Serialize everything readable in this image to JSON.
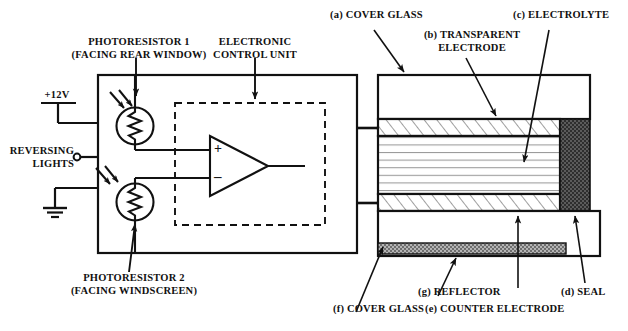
{
  "diagram": {
    "type": "schematic"
  },
  "circuit": {
    "supply_label": "+12V",
    "reversing_label_line1": "REVERSING",
    "reversing_label_line2": "LIGHTS",
    "ecu_label_line1": "ELECTRONIC",
    "ecu_label_line2": "CONTROL UNIT",
    "photoresistor1_line1": "PHOTORESISTOR 1",
    "photoresistor1_line2": "(FACING REAR WINDOW)",
    "photoresistor2_line1": "PHOTORESISTOR 2",
    "photoresistor2_line2": "(FACING WINDSCREEN)",
    "opamp_plus": "+",
    "opamp_minus": "–"
  },
  "cell": {
    "layers": [
      {
        "key": "a",
        "label": "(a) COVER GLASS",
        "name": "cover-glass-top",
        "fill": "white"
      },
      {
        "key": "b",
        "label": "(b) TRANSPARENT",
        "label2": "ELECTRODE",
        "name": "transparent-electrode",
        "fill": "hatch"
      },
      {
        "key": "c",
        "label": "(c) ELECTROLYTE",
        "name": "electrolyte",
        "fill": "lines"
      },
      {
        "key": "d",
        "label": "(d) SEAL",
        "name": "seal",
        "fill": "dark-stipple"
      },
      {
        "key": "e",
        "label": "(e) COUNTER ELECTRODE",
        "name": "counter-electrode",
        "fill": "hatch"
      },
      {
        "key": "f",
        "label": "(f) COVER GLASS",
        "name": "cover-glass-bottom",
        "fill": "white"
      },
      {
        "key": "g",
        "label": "(g) REFLECTOR",
        "name": "reflector",
        "fill": "mid-stipple"
      }
    ],
    "label_a": "(a) COVER GLASS",
    "label_b_line1": "(b) TRANSPARENT",
    "label_b_line2": "ELECTRODE",
    "label_c": "(c) ELECTROLYTE",
    "label_d": "(d) SEAL",
    "label_e": "(e) COUNTER ELECTRODE",
    "label_f": "(f) COVER GLASS",
    "label_g": "(g) REFLECTOR"
  },
  "colors": {
    "stroke": "#111111",
    "background": "#ffffff",
    "seal_fill": "#4a4a4a",
    "reflector_fill": "#8f8f8f",
    "electrolyte_line": "#9a9a9a"
  }
}
